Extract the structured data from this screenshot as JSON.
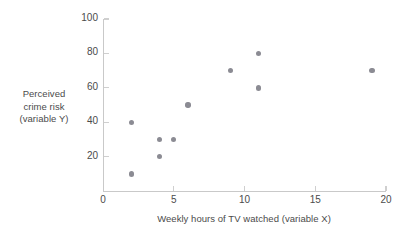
{
  "chart_data": {
    "type": "scatter",
    "title": "",
    "xlabel": "Weekly hours of TV watched (variable X)",
    "ylabel": "Perceived crime risk (variable Y)",
    "ylabel_lines": [
      "Perceived",
      "crime risk",
      "(variable Y)"
    ],
    "xlim": [
      0,
      20
    ],
    "ylim": [
      0,
      100
    ],
    "xticks": [
      0,
      5,
      10,
      15,
      20
    ],
    "yticks": [
      20,
      40,
      60,
      80,
      100
    ],
    "xtick_labels": [
      "0",
      "5",
      "10",
      "15",
      "20"
    ],
    "ytick_labels": [
      "20",
      "40",
      "60",
      "80",
      "100"
    ],
    "grid": false,
    "legend": null,
    "point_color": "#8b8b93",
    "axis_color": "#c9c9c9",
    "x": [
      2,
      2,
      4,
      4,
      5,
      6,
      9,
      11,
      11,
      19
    ],
    "y": [
      40,
      10,
      30,
      20,
      30,
      50,
      70,
      80,
      60,
      70
    ],
    "points": [
      {
        "x": 2,
        "y": 40
      },
      {
        "x": 2,
        "y": 10
      },
      {
        "x": 4,
        "y": 30
      },
      {
        "x": 4,
        "y": 20
      },
      {
        "x": 5,
        "y": 30
      },
      {
        "x": 6,
        "y": 50
      },
      {
        "x": 9,
        "y": 70
      },
      {
        "x": 11,
        "y": 80
      },
      {
        "x": 11,
        "y": 60
      },
      {
        "x": 19,
        "y": 70
      }
    ]
  }
}
